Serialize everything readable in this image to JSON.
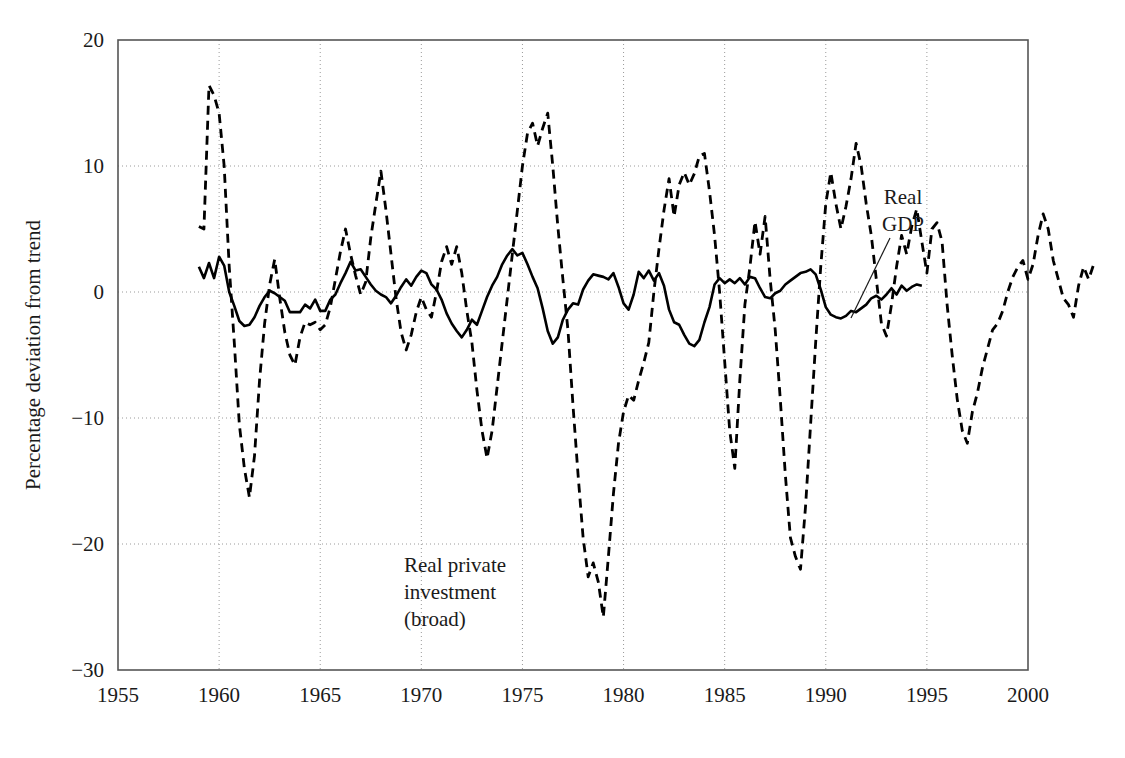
{
  "chart_data": {
    "type": "line",
    "title": "",
    "subtitle": "",
    "xlabel": "",
    "ylabel": "Percentage deviation from trend",
    "xlim": [
      1955,
      2000
    ],
    "ylim": [
      -30,
      20
    ],
    "xticks": [
      1955,
      1960,
      1965,
      1970,
      1975,
      1980,
      1985,
      1990,
      1995,
      2000
    ],
    "xtick_labels": [
      "1955",
      "1960",
      "1965",
      "1970",
      "1975",
      "1980",
      "1985",
      "1990",
      "1995",
      "2000"
    ],
    "yticks": [
      -30,
      -20,
      -10,
      0,
      10,
      20
    ],
    "ytick_labels": [
      "−30",
      "−20",
      "−10",
      "0",
      "10",
      "20"
    ],
    "grid": true,
    "grid_style": "dotted",
    "grid_color": "#9a9a9a",
    "frame_color": "#555555",
    "background": "#ffffff",
    "legend_position": "inline-annotations",
    "annotations": [
      {
        "name": "real-private-investment-label",
        "text_lines": [
          "Real private",
          "investment",
          "(broad)"
        ],
        "x_px": 404,
        "y_px": 572,
        "anchor": "start",
        "leader": false
      },
      {
        "name": "real-gdp-label",
        "text_lines": [
          "Real",
          "GDP"
        ],
        "x_px": 903,
        "y_px": 204,
        "anchor": "middle",
        "leader": true,
        "leader_from": [
          890,
          238
        ],
        "leader_to": [
          851,
          318
        ]
      }
    ],
    "series": [
      {
        "name": "Real GDP",
        "style": "solid",
        "color": "#000000",
        "width": 2.6,
        "x_start": 1959.0,
        "x_step": 0.25,
        "values": [
          2.0,
          1.1,
          2.3,
          1.1,
          2.8,
          2.1,
          0.0,
          -1.1,
          -2.3,
          -2.7,
          -2.6,
          -2.0,
          -1.1,
          -0.4,
          0.1,
          -0.1,
          -0.4,
          -0.7,
          -1.6,
          -1.6,
          -1.6,
          -1.0,
          -1.3,
          -0.6,
          -1.5,
          -1.5,
          -0.6,
          -0.2,
          0.7,
          1.5,
          2.4,
          1.7,
          1.8,
          1.2,
          0.6,
          0.1,
          -0.2,
          -0.4,
          -0.9,
          -0.3,
          0.4,
          1.0,
          0.5,
          1.2,
          1.7,
          1.5,
          0.6,
          0.2,
          -0.6,
          -1.7,
          -2.5,
          -3.1,
          -3.6,
          -3.0,
          -2.2,
          -2.6,
          -1.5,
          -0.4,
          0.5,
          1.2,
          2.2,
          2.9,
          3.4,
          2.9,
          3.1,
          2.2,
          1.2,
          0.3,
          -1.3,
          -3.1,
          -4.1,
          -3.6,
          -2.2,
          -1.4,
          -0.9,
          -1.0,
          0.2,
          0.9,
          1.4,
          1.3,
          1.2,
          1.0,
          1.5,
          0.4,
          -0.9,
          -1.4,
          -0.2,
          1.6,
          1.1,
          1.7,
          0.9,
          1.5,
          0.5,
          -1.4,
          -2.4,
          -2.6,
          -3.4,
          -4.1,
          -4.3,
          -3.8,
          -2.4,
          -1.2,
          0.6,
          1.1,
          0.7,
          1.0,
          0.7,
          1.1,
          0.6,
          1.2,
          1.1,
          0.3,
          -0.4,
          -0.5,
          -0.1,
          0.1,
          0.6,
          0.9,
          1.2,
          1.5,
          1.6,
          1.8,
          1.4,
          0.2,
          -1.2,
          -1.8,
          -2.0,
          -2.1,
          -1.9,
          -1.5,
          -1.6,
          -1.3,
          -1.0,
          -0.5,
          -0.3,
          -0.6,
          -0.2,
          0.3,
          -0.2,
          0.5,
          0.1,
          0.4,
          0.6,
          0.5
        ]
      },
      {
        "name": "Real private investment (broad)",
        "style": "dashed",
        "color": "#000000",
        "width": 2.8,
        "dash": "9,6",
        "x_start": 1959.0,
        "x_step": 0.25,
        "values": [
          5.2,
          5.0,
          16.4,
          15.6,
          14.2,
          10.0,
          2.0,
          -4.0,
          -10.5,
          -14.0,
          -16.3,
          -13.0,
          -7.0,
          -2.5,
          0.6,
          2.6,
          -0.5,
          -3.2,
          -5.0,
          -5.8,
          -3.6,
          -2.4,
          -2.6,
          -2.4,
          -3.0,
          -2.6,
          -1.2,
          1.0,
          3.2,
          5.0,
          3.0,
          1.3,
          -0.2,
          0.8,
          4.3,
          7.0,
          9.6,
          6.5,
          3.0,
          -0.5,
          -3.2,
          -4.6,
          -3.4,
          -1.6,
          -0.4,
          -1.4,
          -2.0,
          0.0,
          2.4,
          3.6,
          2.2,
          3.6,
          1.5,
          -1.5,
          -4.0,
          -7.8,
          -11.0,
          -13.2,
          -11.0,
          -7.5,
          -4.0,
          -0.5,
          3.0,
          6.5,
          10.0,
          12.6,
          13.4,
          11.6,
          13.0,
          14.2,
          10.0,
          5.2,
          1.0,
          -3.0,
          -9.0,
          -14.5,
          -19.5,
          -22.6,
          -21.5,
          -23.0,
          -25.8,
          -21.0,
          -16.0,
          -12.0,
          -9.5,
          -8.2,
          -8.6,
          -7.0,
          -5.6,
          -4.0,
          0.0,
          3.4,
          6.5,
          9.0,
          6.0,
          8.5,
          9.5,
          8.5,
          9.4,
          10.8,
          11.0,
          8.0,
          4.5,
          0.0,
          -5.5,
          -11.0,
          -14.0,
          -7.0,
          -1.0,
          2.0,
          5.6,
          3.0,
          6.0,
          1.0,
          -3.0,
          -8.5,
          -14.5,
          -19.5,
          -21.0,
          -22.0,
          -17.0,
          -10.5,
          -4.0,
          2.0,
          7.0,
          9.5,
          7.0,
          5.0,
          6.8,
          9.0,
          11.8,
          10.0,
          7.0,
          4.5,
          1.0,
          -2.5,
          -3.5,
          -1.0,
          2.0,
          4.5,
          3.0,
          5.2,
          6.6,
          4.0,
          1.5,
          5.0,
          5.5,
          4.0,
          -1.0,
          -5.0,
          -8.5,
          -11.0,
          -12.0,
          -9.5,
          -8.0,
          -6.0,
          -4.5,
          -3.0,
          -2.5,
          -1.5,
          0.0,
          1.2,
          2.0,
          2.5,
          1.0,
          2.2,
          4.5,
          6.2,
          5.0,
          2.5,
          1.0,
          -0.5,
          -1.0,
          -2.0,
          0.5,
          2.0,
          1.0,
          2.2
        ]
      }
    ]
  },
  "plot_geometry": {
    "left_px": 118,
    "right_px": 1028,
    "top_px": 40,
    "bottom_px": 670
  }
}
